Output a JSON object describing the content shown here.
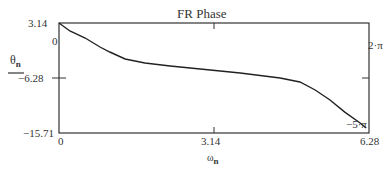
{
  "chart_data": {
    "type": "line",
    "title": "FR Phase",
    "xlabel": "ω_n",
    "ylabel": "θ_n",
    "xlim": [
      0,
      6.28
    ],
    "ylim": [
      -15.71,
      3.14
    ],
    "x_ticks": [
      "0",
      "3.14",
      "6.28"
    ],
    "y_ticks_left": [
      "3.14",
      "0",
      "-6.28",
      "-15.71"
    ],
    "y_markers_right": [
      "2·π",
      "-5·π"
    ],
    "grid": false,
    "legend": null,
    "series": [
      {
        "name": "θ_n",
        "x": [
          0.0,
          0.22,
          0.53,
          0.83,
          1.03,
          1.34,
          1.74,
          2.25,
          2.86,
          3.67,
          4.48,
          4.88,
          5.19,
          5.49,
          5.79,
          6.1,
          6.22
        ],
        "y": [
          3.14,
          1.77,
          0.57,
          -0.98,
          -1.83,
          -3.03,
          -3.72,
          -4.23,
          -4.75,
          -5.43,
          -6.29,
          -6.97,
          -8.34,
          -10.06,
          -12.12,
          -14.0,
          -14.86
        ]
      }
    ]
  },
  "labels": {
    "title": "FR Phase",
    "y_name": "θ",
    "y_sub": "n",
    "x_name": "ω",
    "x_sub": "n",
    "y_top": "3.14",
    "y_zero": "0",
    "y_mid": "−6.28",
    "y_bottom": "−15.71",
    "x_left": "0",
    "x_mid": "3.14",
    "x_right": "6.28",
    "right_top": "2·π",
    "right_bottom": "−5·π"
  }
}
